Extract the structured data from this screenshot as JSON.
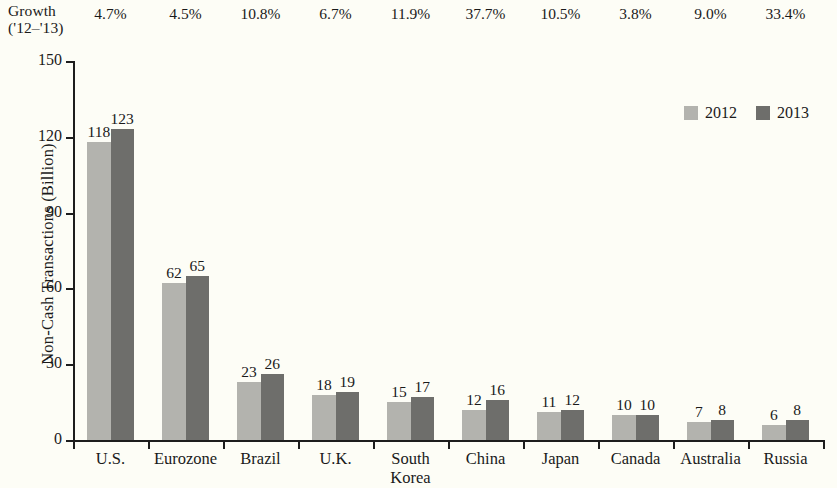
{
  "growth_header": {
    "line1": "Growth",
    "line2": "('12–'13)"
  },
  "legend": {
    "position": "top-right",
    "items": [
      {
        "label": "2012",
        "color": "#b3b3ae"
      },
      {
        "label": "2013",
        "color": "#6e6e6b"
      }
    ]
  },
  "chart_data": {
    "type": "bar",
    "title": "",
    "subtitle": "",
    "xlabel": "",
    "ylabel": "Non-Cash Transactions (Billion)",
    "ylim": [
      0,
      150
    ],
    "yticks": [
      "0",
      "30",
      "60",
      "90",
      "120",
      "150"
    ],
    "ytick_values": [
      0,
      30,
      60,
      90,
      120,
      150
    ],
    "grid": false,
    "legend_position": "top-right",
    "categories": [
      "U.S.",
      "Eurozone",
      "Brazil",
      "U.K.",
      "South Korea",
      "China",
      "Japan",
      "Canada",
      "Australia",
      "Russia"
    ],
    "category_lines": [
      [
        "U.S."
      ],
      [
        "Eurozone"
      ],
      [
        "Brazil"
      ],
      [
        "U.K."
      ],
      [
        "South",
        "Korea"
      ],
      [
        "China"
      ],
      [
        "Japan"
      ],
      [
        "Canada"
      ],
      [
        "Australia"
      ],
      [
        "Russia"
      ]
    ],
    "series": [
      {
        "name": "2012",
        "color": "#b3b3ae",
        "values": [
          118,
          62,
          23,
          18,
          15,
          12,
          11,
          10,
          7,
          6
        ]
      },
      {
        "name": "2013",
        "color": "#6e6e6b",
        "values": [
          123,
          65,
          26,
          19,
          17,
          16,
          12,
          10,
          8,
          8
        ]
      }
    ],
    "annotations": {
      "row_label": "Growth ('12–'13)",
      "growth_values": [
        "4.7%",
        "4.5%",
        "10.8%",
        "6.7%",
        "11.9%",
        "37.7%",
        "10.5%",
        "3.8%",
        "9.0%",
        "33.4%"
      ]
    }
  }
}
